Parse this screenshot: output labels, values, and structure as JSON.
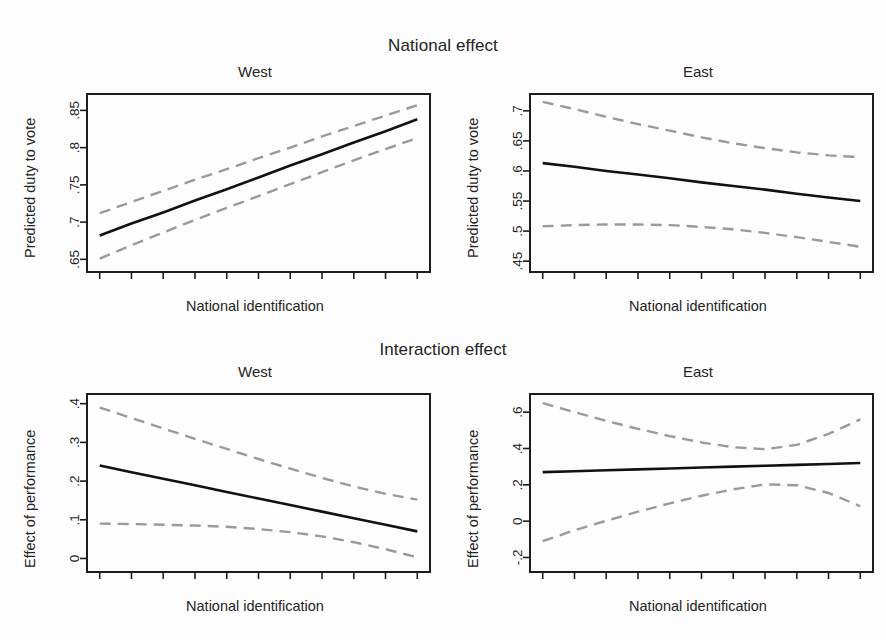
{
  "figure": {
    "width": 886,
    "height": 640,
    "background": "#fdfdfd",
    "fit_color": "#111111",
    "ci_color": "#9a9a9a",
    "axis_color": "#1d1d1d"
  },
  "blocks": [
    {
      "title": "National effect"
    },
    {
      "title": "Interaction effect"
    }
  ],
  "chart_data": [
    {
      "type": "line",
      "title": "National effect",
      "panel": "West",
      "xlabel": "National identification",
      "ylabel": "Predicted duty to vote",
      "xlim": [
        -0.04,
        1.04
      ],
      "ylim": [
        0.633,
        0.872
      ],
      "xticks": [
        0,
        0.1,
        0.2,
        0.3,
        0.4,
        0.5,
        0.6,
        0.7,
        0.8,
        0.9,
        1
      ],
      "xticklabels": [
        "0",
        ".1",
        ".2",
        ".3",
        ".4",
        ".5",
        ".6",
        ".7",
        ".8",
        ".9",
        "1"
      ],
      "yticks": [
        0.65,
        0.7,
        0.75,
        0.8,
        0.85
      ],
      "yticklabels": [
        ".65",
        ".7",
        ".75",
        ".8",
        ".85"
      ],
      "grid": false,
      "legend": "none",
      "x": [
        0,
        0.1,
        0.2,
        0.3,
        0.4,
        0.5,
        0.6,
        0.7,
        0.8,
        0.9,
        1
      ],
      "series": [
        {
          "name": "Predicted value",
          "style": "solid",
          "color": "#111111",
          "values": [
            0.682,
            0.698,
            0.713,
            0.729,
            0.744,
            0.76,
            0.776,
            0.791,
            0.807,
            0.822,
            0.838
          ]
        },
        {
          "name": "Upper 95% CI",
          "style": "dashed",
          "color": "#9a9a9a",
          "values": [
            0.712,
            0.727,
            0.742,
            0.757,
            0.771,
            0.786,
            0.8,
            0.815,
            0.829,
            0.843,
            0.857
          ]
        },
        {
          "name": "Lower 95% CI",
          "style": "dashed",
          "color": "#9a9a9a",
          "values": [
            0.651,
            0.669,
            0.686,
            0.703,
            0.719,
            0.735,
            0.751,
            0.767,
            0.783,
            0.798,
            0.813
          ]
        }
      ]
    },
    {
      "type": "line",
      "title": "National effect",
      "panel": "East",
      "xlabel": "National identification",
      "ylabel": "Predicted duty to vote",
      "xlim": [
        -0.04,
        1.04
      ],
      "ylim": [
        0.432,
        0.728
      ],
      "xticks": [
        0,
        0.1,
        0.2,
        0.3,
        0.4,
        0.5,
        0.6,
        0.7,
        0.8,
        0.9,
        1
      ],
      "xticklabels": [
        "0",
        ".1",
        ".2",
        ".3",
        ".4",
        ".5",
        ".6",
        ".7",
        ".8",
        ".9",
        "1"
      ],
      "yticks": [
        0.45,
        0.5,
        0.55,
        0.6,
        0.65,
        0.7
      ],
      "yticklabels": [
        ".45",
        ".5",
        ".55",
        ".6",
        ".65",
        ".7"
      ],
      "grid": false,
      "legend": "none",
      "x": [
        0,
        0.1,
        0.2,
        0.3,
        0.4,
        0.5,
        0.6,
        0.7,
        0.8,
        0.9,
        1
      ],
      "series": [
        {
          "name": "Predicted value",
          "style": "solid",
          "color": "#111111",
          "values": [
            0.613,
            0.607,
            0.6,
            0.594,
            0.588,
            0.581,
            0.575,
            0.569,
            0.562,
            0.556,
            0.55
          ]
        },
        {
          "name": "Upper 95% CI",
          "style": "dashed",
          "color": "#9a9a9a",
          "values": [
            0.715,
            0.703,
            0.69,
            0.678,
            0.667,
            0.656,
            0.646,
            0.638,
            0.631,
            0.626,
            0.623
          ]
        },
        {
          "name": "Lower 95% CI",
          "style": "dashed",
          "color": "#9a9a9a",
          "values": [
            0.508,
            0.51,
            0.511,
            0.511,
            0.51,
            0.507,
            0.503,
            0.497,
            0.49,
            0.482,
            0.474
          ]
        }
      ]
    },
    {
      "type": "line",
      "title": "Interaction effect",
      "panel": "West",
      "xlabel": "National identification",
      "ylabel": "Effect of performance",
      "xlim": [
        -0.04,
        1.04
      ],
      "ylim": [
        -0.035,
        0.425
      ],
      "xticks": [
        0,
        0.1,
        0.2,
        0.3,
        0.4,
        0.5,
        0.6,
        0.7,
        0.8,
        0.9,
        1
      ],
      "xticklabels": [
        "0",
        ".1",
        ".2",
        ".3",
        ".4",
        ".5",
        ".6",
        ".7",
        ".8",
        ".9",
        "1"
      ],
      "yticks": [
        0,
        0.1,
        0.2,
        0.3,
        0.4
      ],
      "yticklabels": [
        "0",
        ".1",
        ".2",
        ".3",
        ".4"
      ],
      "grid": false,
      "legend": "none",
      "x": [
        0,
        0.1,
        0.2,
        0.3,
        0.4,
        0.5,
        0.6,
        0.7,
        0.8,
        0.9,
        1
      ],
      "series": [
        {
          "name": "Predicted value",
          "style": "solid",
          "color": "#111111",
          "values": [
            0.24,
            0.223,
            0.206,
            0.189,
            0.172,
            0.155,
            0.138,
            0.121,
            0.104,
            0.087,
            0.07
          ]
        },
        {
          "name": "Upper 95% CI",
          "style": "dashed",
          "color": "#9a9a9a",
          "values": [
            0.39,
            0.363,
            0.336,
            0.309,
            0.283,
            0.257,
            0.232,
            0.208,
            0.186,
            0.167,
            0.152
          ]
        },
        {
          "name": "Lower 95% CI",
          "style": "dashed",
          "color": "#9a9a9a",
          "values": [
            0.09,
            0.089,
            0.087,
            0.085,
            0.082,
            0.076,
            0.068,
            0.057,
            0.042,
            0.024,
            0.003
          ]
        }
      ]
    },
    {
      "type": "line",
      "title": "Interaction effect",
      "panel": "East",
      "xlabel": "National identification",
      "ylabel": "Effect of performance",
      "xlim": [
        -0.04,
        1.04
      ],
      "ylim": [
        -0.28,
        0.7
      ],
      "xticks": [
        0,
        0.1,
        0.2,
        0.3,
        0.4,
        0.5,
        0.6,
        0.7,
        0.8,
        0.9,
        1
      ],
      "xticklabels": [
        "0",
        ".1",
        ".2",
        ".3",
        ".4",
        ".5",
        ".6",
        ".7",
        ".8",
        ".9",
        "1"
      ],
      "yticks": [
        -0.2,
        0,
        0.2,
        0.4,
        0.6
      ],
      "yticklabels": [
        "-.2",
        "0",
        ".2",
        ".4",
        ".6"
      ],
      "grid": false,
      "legend": "none",
      "x": [
        0,
        0.1,
        0.2,
        0.3,
        0.4,
        0.5,
        0.6,
        0.7,
        0.8,
        0.9,
        1
      ],
      "series": [
        {
          "name": "Predicted value",
          "style": "solid",
          "color": "#111111",
          "values": [
            0.27,
            0.275,
            0.28,
            0.285,
            0.29,
            0.295,
            0.3,
            0.305,
            0.31,
            0.315,
            0.32
          ]
        },
        {
          "name": "Upper 95% CI",
          "style": "dashed",
          "color": "#9a9a9a",
          "values": [
            0.65,
            0.6,
            0.552,
            0.508,
            0.468,
            0.433,
            0.407,
            0.396,
            0.42,
            0.48,
            0.56
          ]
        },
        {
          "name": "Lower 95% CI",
          "style": "dashed",
          "color": "#9a9a9a",
          "values": [
            -0.11,
            -0.05,
            0.002,
            0.052,
            0.098,
            0.14,
            0.175,
            0.202,
            0.198,
            0.155,
            0.082
          ]
        }
      ]
    }
  ]
}
